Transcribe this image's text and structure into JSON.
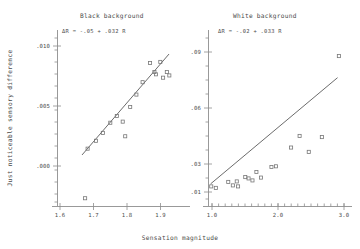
{
  "figure": {
    "xlabel": "Sensation magnitude",
    "ylabel": "Just noticeable sensory difference"
  },
  "panels": {
    "left": {
      "title": "Black background",
      "equation": "ΔR = -.05 + .032 R",
      "xticklabels": [
        "1.6",
        "1.7",
        "1.8",
        "1.9"
      ],
      "yticklabels": [
        ".010",
        ".005",
        ".000"
      ]
    },
    "right": {
      "title": "White background",
      "equation": "ΔR = -.02 + .033 R",
      "xticklabels": [
        "1.0",
        "2.0",
        "3.0"
      ],
      "yticklabels": [
        ".09",
        ".06",
        ".03",
        ".01"
      ]
    }
  },
  "chart_data": [
    {
      "type": "scatter",
      "title": "Black background",
      "panel": "left",
      "xlabel": "Sensation magnitude",
      "ylabel": "Just noticeable sensory difference",
      "xlim": [
        1.55,
        1.97
      ],
      "ylim": [
        -0.0018,
        0.0132
      ],
      "xticks": [
        1.6,
        1.7,
        1.8,
        1.9
      ],
      "yticks": [
        0.0,
        0.005,
        0.01
      ],
      "grid": false,
      "legend": null,
      "annotations": [
        {
          "text": "ΔR = -.05 + .032 R",
          "x": 1.63,
          "y": 0.0123
        }
      ],
      "fit_line": {
        "label": "ΔR = -.05 + .032 R",
        "intercept": -0.05,
        "slope": 0.032,
        "x_start": 1.645,
        "x_end": 1.925,
        "y_start": 0.00264,
        "y_end": 0.0116
      },
      "points": [
        {
          "x": 1.655,
          "y": -0.0012
        },
        {
          "x": 1.663,
          "y": 0.0032
        },
        {
          "x": 1.69,
          "y": 0.0039
        },
        {
          "x": 1.712,
          "y": 0.0046
        },
        {
          "x": 1.736,
          "y": 0.0055
        },
        {
          "x": 1.757,
          "y": 0.0061
        },
        {
          "x": 1.776,
          "y": 0.0056
        },
        {
          "x": 1.784,
          "y": 0.0043
        },
        {
          "x": 1.8,
          "y": 0.0069
        },
        {
          "x": 1.82,
          "y": 0.008
        },
        {
          "x": 1.84,
          "y": 0.0091
        },
        {
          "x": 1.864,
          "y": 0.0108
        },
        {
          "x": 1.878,
          "y": 0.01
        },
        {
          "x": 1.883,
          "y": 0.0098
        },
        {
          "x": 1.897,
          "y": 0.0109
        },
        {
          "x": 1.906,
          "y": 0.0095
        },
        {
          "x": 1.918,
          "y": 0.01
        },
        {
          "x": 1.926,
          "y": 0.0097
        }
      ]
    },
    {
      "type": "scatter",
      "title": "White background",
      "panel": "right",
      "xlabel": "Sensation magnitude",
      "ylabel": "Just noticeable sensory difference",
      "xlim": [
        0.95,
        3.15
      ],
      "ylim": [
        0.004,
        0.104
      ],
      "xticks": [
        1.0,
        2.0,
        3.0
      ],
      "yticks": [
        0.01,
        0.03,
        0.06,
        0.09
      ],
      "grid": false,
      "legend": null,
      "annotations": [
        {
          "text": "ΔR = -.02 + .033 R",
          "x": 1.35,
          "y": 0.0955
        }
      ],
      "fit_line": {
        "label": "ΔR = -.02 + .033 R",
        "intercept": -0.02,
        "slope": 0.033,
        "x_start": 1.02,
        "x_end": 2.96,
        "y_start": 0.0137,
        "y_end": 0.0777
      },
      "points": [
        {
          "x": 1.03,
          "y": 0.0122
        },
        {
          "x": 1.1,
          "y": 0.0113
        },
        {
          "x": 1.29,
          "y": 0.0149
        },
        {
          "x": 1.36,
          "y": 0.0128
        },
        {
          "x": 1.42,
          "y": 0.0152
        },
        {
          "x": 1.44,
          "y": 0.0122
        },
        {
          "x": 1.55,
          "y": 0.0178
        },
        {
          "x": 1.6,
          "y": 0.017
        },
        {
          "x": 1.66,
          "y": 0.0158
        },
        {
          "x": 1.72,
          "y": 0.0209
        },
        {
          "x": 1.79,
          "y": 0.0175
        },
        {
          "x": 1.95,
          "y": 0.0239
        },
        {
          "x": 2.02,
          "y": 0.0243
        },
        {
          "x": 2.25,
          "y": 0.0356
        },
        {
          "x": 2.38,
          "y": 0.0426
        },
        {
          "x": 2.52,
          "y": 0.033
        },
        {
          "x": 2.72,
          "y": 0.0419
        },
        {
          "x": 2.98,
          "y": 0.0907
        }
      ]
    }
  ]
}
